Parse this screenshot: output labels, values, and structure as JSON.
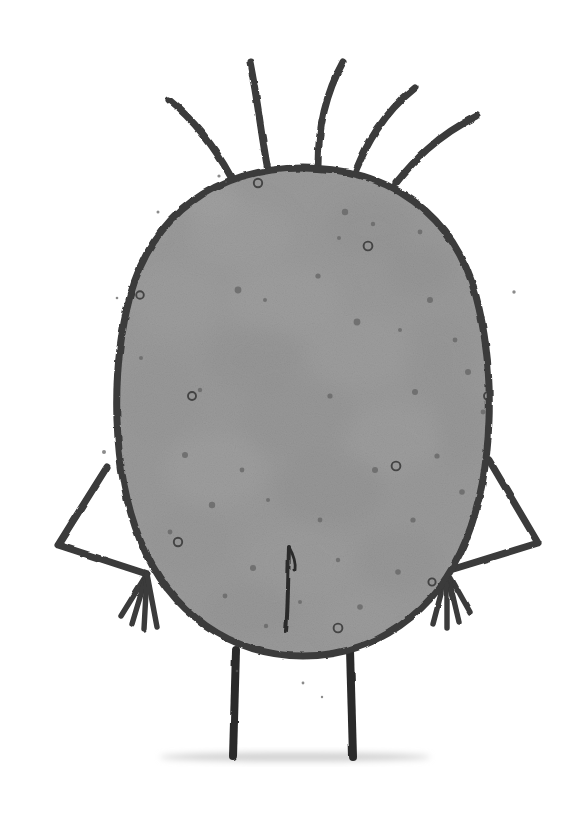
{
  "canvas": {
    "width": 578,
    "height": 814,
    "background_color": "#ffffff",
    "medium": "ink and grey watercolour wash on white paper",
    "title": "Hand-drawn grey blob creature"
  },
  "palette": {
    "background": "#ffffff",
    "ink_dark": "#3a3a3a",
    "ink_darkest": "#2b2b2b",
    "body_fill_base": "#9a9a9a",
    "body_fill_light": "#ababab",
    "body_fill_dark": "#888888",
    "body_fill_shadow": "#7e7e7e",
    "speckle_dark": "#6a6a6a",
    "speckle_ring": "#4a4a4a",
    "ground_shadow": "#c9c9c9"
  },
  "subject": {
    "name": "blob-creature",
    "description": "A large rounded grey egg-shaped body with five spiky hairs on top, two bent stick arms with four-fingered hands, two straight stick legs, and a short vertical crease down the lower centre of the body.",
    "parts": [
      "hair-strands",
      "body",
      "body-texture",
      "body-speckles",
      "left-arm",
      "right-arm",
      "left-hand-fingers",
      "right-hand-fingers",
      "belly-crease",
      "left-leg",
      "right-leg",
      "ground-shadow"
    ]
  },
  "body": {
    "label": "body",
    "shape": "egg / rounded-oval",
    "center_x": 303,
    "center_y": 412,
    "radius_x": 186,
    "radius_y": 245,
    "top_y": 168,
    "bottom_y": 656,
    "left_x": 118,
    "right_x": 492,
    "outline_width": 7,
    "outline_color": "#3a3a3a",
    "fill_color": "#9a9a9a",
    "path": "M 303 168 C 215 168 152 215 130 296 C 110 372 112 470 140 540 C 170 614 232 656 303 656 C 374 656 436 614 466 540 C 494 470 496 372 476 296 C 454 215 391 168 303 168 Z"
  },
  "hair": {
    "label": "hair-strands",
    "count": 5,
    "stroke_color": "#3a3a3a",
    "strands": [
      {
        "name": "hair-strand-1",
        "path": "M 231 177 C 218 153 200 125 169 100",
        "width": 7,
        "side": "far-left"
      },
      {
        "name": "hair-strand-2",
        "path": "M 268 170 C 262 140 258 102 250 62",
        "width": 7,
        "side": "left"
      },
      {
        "name": "hair-strand-3",
        "path": "M 318 166 C 318 138 322 100 343 62",
        "width": 7,
        "side": "center"
      },
      {
        "name": "hair-strand-4",
        "path": "M 356 170 C 366 146 382 114 415 88",
        "width": 7,
        "side": "right"
      },
      {
        "name": "hair-strand-5",
        "path": "M 396 183 C 412 163 436 136 477 116",
        "width": 7,
        "side": "far-right"
      }
    ]
  },
  "arms": {
    "label": "arms",
    "stroke_color": "#3a3a3a",
    "stroke_width": 7,
    "left": {
      "name": "left-arm",
      "shoulder": {
        "x": 107,
        "y": 467
      },
      "elbow": {
        "x": 58,
        "y": 545
      },
      "wrist": {
        "x": 147,
        "y": 574
      },
      "path": "M 107 467 L 58 545 L 147 574",
      "fingers": [
        "M 147 574 L 121 616",
        "M 147 574 L 132 624",
        "M 147 574 L 144 629",
        "M 147 574 L 157 627"
      ]
    },
    "right": {
      "name": "right-arm",
      "shoulder": {
        "x": 489,
        "y": 460
      },
      "elbow": {
        "x": 538,
        "y": 543
      },
      "wrist": {
        "x": 447,
        "y": 571
      },
      "path": "M 489 460 L 538 543 L 447 571",
      "fingers": [
        "M 447 571 L 470 612",
        "M 447 571 L 459 622",
        "M 447 571 L 447 628",
        "M 447 571 L 433 624"
      ]
    }
  },
  "legs": {
    "label": "legs",
    "stroke_color": "#2b2b2b",
    "stroke_width": 8,
    "left": {
      "name": "left-leg",
      "x_top": 236,
      "y_top": 650,
      "x_bottom": 233,
      "y_bottom": 757
    },
    "right": {
      "name": "right-leg",
      "x_top": 350,
      "y_top": 650,
      "x_bottom": 353,
      "y_bottom": 757
    }
  },
  "belly_crease": {
    "label": "belly-crease",
    "description": "short vertical ink line with a small V fork at the top",
    "stroke_color": "#2b2b2b",
    "main_path": "M 289 547 C 288 580 288 612 286 631",
    "fork_path": "M 289 547 C 294 556 296 563 295 570",
    "stroke_width": 4,
    "top_y": 543,
    "bottom_y": 632,
    "x": 289
  },
  "ground_shadow": {
    "label": "ground-shadow",
    "color": "#c9c9c9",
    "center_x": 295,
    "y": 757,
    "width": 270,
    "height": 9
  },
  "body_texture": {
    "label": "body-texture",
    "description": "mottled watercolour blooms — lighter and darker patches across the body",
    "blobs": [
      {
        "cx": 240,
        "cy": 235,
        "rx": 52,
        "ry": 34,
        "color": "#a6a6a6",
        "opacity": 0.55
      },
      {
        "cx": 370,
        "cy": 228,
        "rx": 44,
        "ry": 30,
        "color": "#8d8d8d",
        "opacity": 0.5
      },
      {
        "cx": 420,
        "cy": 270,
        "rx": 34,
        "ry": 26,
        "color": "#8a8a8a",
        "opacity": 0.45
      },
      {
        "cx": 175,
        "cy": 300,
        "rx": 46,
        "ry": 38,
        "color": "#a4a4a4",
        "opacity": 0.5
      },
      {
        "cx": 285,
        "cy": 300,
        "rx": 58,
        "ry": 36,
        "color": "#a8a8a8",
        "opacity": 0.45
      },
      {
        "cx": 255,
        "cy": 360,
        "rx": 48,
        "ry": 34,
        "color": "#8c8c8c",
        "opacity": 0.45
      },
      {
        "cx": 360,
        "cy": 350,
        "rx": 52,
        "ry": 38,
        "color": "#a5a5a5",
        "opacity": 0.45
      },
      {
        "cx": 440,
        "cy": 360,
        "rx": 34,
        "ry": 44,
        "color": "#8f8f8f",
        "opacity": 0.4
      },
      {
        "cx": 160,
        "cy": 400,
        "rx": 40,
        "ry": 44,
        "color": "#909090",
        "opacity": 0.4
      },
      {
        "cx": 300,
        "cy": 420,
        "rx": 60,
        "ry": 40,
        "color": "#8b8b8b",
        "opacity": 0.4
      },
      {
        "cx": 390,
        "cy": 440,
        "rx": 48,
        "ry": 36,
        "color": "#a6a6a6",
        "opacity": 0.45
      },
      {
        "cx": 215,
        "cy": 470,
        "rx": 50,
        "ry": 36,
        "color": "#a8a8a8",
        "opacity": 0.5
      },
      {
        "cx": 330,
        "cy": 490,
        "rx": 56,
        "ry": 38,
        "color": "#8a8a8a",
        "opacity": 0.45
      },
      {
        "cx": 430,
        "cy": 490,
        "rx": 36,
        "ry": 34,
        "color": "#979797",
        "opacity": 0.4
      },
      {
        "cx": 190,
        "cy": 540,
        "rx": 44,
        "ry": 34,
        "color": "#929292",
        "opacity": 0.45
      },
      {
        "cx": 300,
        "cy": 560,
        "rx": 54,
        "ry": 36,
        "color": "#a2a2a2",
        "opacity": 0.4
      },
      {
        "cx": 400,
        "cy": 560,
        "rx": 44,
        "ry": 32,
        "color": "#8d8d8d",
        "opacity": 0.45
      },
      {
        "cx": 250,
        "cy": 610,
        "rx": 48,
        "ry": 28,
        "color": "#8e8e8e",
        "opacity": 0.45
      },
      {
        "cx": 360,
        "cy": 615,
        "rx": 42,
        "ry": 26,
        "color": "#a0a0a0",
        "opacity": 0.4
      },
      {
        "cx": 210,
        "cy": 200,
        "rx": 30,
        "ry": 20,
        "color": "#adadad",
        "opacity": 0.5
      },
      {
        "cx": 462,
        "cy": 430,
        "rx": 26,
        "ry": 40,
        "color": "#8b8b8b",
        "opacity": 0.35
      },
      {
        "cx": 140,
        "cy": 470,
        "rx": 26,
        "ry": 40,
        "color": "#949494",
        "opacity": 0.35
      }
    ]
  },
  "speckles": {
    "label": "body-speckles",
    "description": "small solid dots and tiny open ink rings scattered over the body",
    "dot_color": "#6a6a6a",
    "ring_color": "#3f3f3f",
    "dots": [
      {
        "cx": 345,
        "cy": 212,
        "r": 3.2
      },
      {
        "cx": 373,
        "cy": 224,
        "r": 2.2
      },
      {
        "cx": 339,
        "cy": 238,
        "r": 2.0
      },
      {
        "cx": 456,
        "cy": 246,
        "r": 3.0
      },
      {
        "cx": 420,
        "cy": 232,
        "r": 2.4
      },
      {
        "cx": 238,
        "cy": 290,
        "r": 3.4
      },
      {
        "cx": 265,
        "cy": 300,
        "r": 2.0
      },
      {
        "cx": 430,
        "cy": 300,
        "r": 3.0
      },
      {
        "cx": 472,
        "cy": 288,
        "r": 2.4
      },
      {
        "cx": 482,
        "cy": 312,
        "r": 2.0
      },
      {
        "cx": 357,
        "cy": 322,
        "r": 3.4
      },
      {
        "cx": 400,
        "cy": 330,
        "r": 2.0
      },
      {
        "cx": 318,
        "cy": 276,
        "r": 2.6
      },
      {
        "cx": 455,
        "cy": 340,
        "r": 2.4
      },
      {
        "cx": 468,
        "cy": 372,
        "r": 3.0
      },
      {
        "cx": 200,
        "cy": 390,
        "r": 2.2
      },
      {
        "cx": 415,
        "cy": 392,
        "r": 3.0
      },
      {
        "cx": 330,
        "cy": 396,
        "r": 2.6
      },
      {
        "cx": 483,
        "cy": 412,
        "r": 2.4
      },
      {
        "cx": 185,
        "cy": 455,
        "r": 3.0
      },
      {
        "cx": 242,
        "cy": 470,
        "r": 2.4
      },
      {
        "cx": 375,
        "cy": 470,
        "r": 3.0
      },
      {
        "cx": 437,
        "cy": 456,
        "r": 2.6
      },
      {
        "cx": 462,
        "cy": 492,
        "r": 2.8
      },
      {
        "cx": 212,
        "cy": 505,
        "r": 3.2
      },
      {
        "cx": 268,
        "cy": 500,
        "r": 2.0
      },
      {
        "cx": 320,
        "cy": 520,
        "r": 2.4
      },
      {
        "cx": 413,
        "cy": 520,
        "r": 2.6
      },
      {
        "cx": 170,
        "cy": 532,
        "r": 2.4
      },
      {
        "cx": 253,
        "cy": 568,
        "r": 3.0
      },
      {
        "cx": 338,
        "cy": 560,
        "r": 2.2
      },
      {
        "cx": 398,
        "cy": 572,
        "r": 2.8
      },
      {
        "cx": 225,
        "cy": 596,
        "r": 2.4
      },
      {
        "cx": 300,
        "cy": 602,
        "r": 2.0
      },
      {
        "cx": 360,
        "cy": 607,
        "r": 2.8
      },
      {
        "cx": 266,
        "cy": 626,
        "r": 2.2
      },
      {
        "cx": 390,
        "cy": 630,
        "r": 2.0
      },
      {
        "cx": 511,
        "cy": 290,
        "r": 3.0
      },
      {
        "cx": 497,
        "cy": 358,
        "r": 2.0
      },
      {
        "cx": 141,
        "cy": 358,
        "r": 2.0
      }
    ],
    "rings": [
      {
        "cx": 258,
        "cy": 183,
        "r": 4.2
      },
      {
        "cx": 368,
        "cy": 246,
        "r": 4.4
      },
      {
        "cx": 140,
        "cy": 295,
        "r": 3.8
      },
      {
        "cx": 192,
        "cy": 396,
        "r": 4.0
      },
      {
        "cx": 488,
        "cy": 396,
        "r": 4.0
      },
      {
        "cx": 396,
        "cy": 466,
        "r": 4.4
      },
      {
        "cx": 178,
        "cy": 542,
        "r": 4.2
      },
      {
        "cx": 338,
        "cy": 628,
        "r": 4.4
      },
      {
        "cx": 247,
        "cy": 652,
        "r": 3.6
      },
      {
        "cx": 432,
        "cy": 582,
        "r": 3.6
      }
    ]
  },
  "ink_flecks": {
    "label": "ink-flecks",
    "description": "tiny stray ink splatters outside the outline",
    "color": "#5a5a5a",
    "points": [
      {
        "cx": 219,
        "cy": 176,
        "r": 1.6
      },
      {
        "cx": 226,
        "cy": 182,
        "r": 1.1
      },
      {
        "cx": 158,
        "cy": 212,
        "r": 1.5
      },
      {
        "cx": 117,
        "cy": 298,
        "r": 1.3
      },
      {
        "cx": 104,
        "cy": 452,
        "r": 2.0
      },
      {
        "cx": 514,
        "cy": 292,
        "r": 1.7
      },
      {
        "cx": 303,
        "cy": 683,
        "r": 1.4
      },
      {
        "cx": 322,
        "cy": 697,
        "r": 1.2
      },
      {
        "cx": 237,
        "cy": 671,
        "r": 1.3
      }
    ]
  }
}
